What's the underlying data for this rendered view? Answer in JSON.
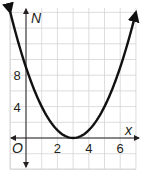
{
  "chart_data": {
    "type": "line",
    "title": "",
    "xlabel": "x",
    "ylabel": "N",
    "origin_label": "O",
    "function": "N = (x - 3)^2",
    "x": [
      -1,
      0,
      1,
      2,
      3,
      4,
      5,
      6,
      7
    ],
    "series": [
      {
        "name": "N",
        "values": [
          16,
          9,
          4,
          1,
          0,
          1,
          4,
          9,
          16
        ]
      }
    ],
    "x_ticks": [
      "2",
      "4",
      "6"
    ],
    "y_ticks": [
      "4",
      "8"
    ],
    "xlim": [
      -1,
      7
    ],
    "ylim": [
      -2,
      17
    ],
    "grid": true,
    "grid_step_x": 1,
    "grid_step_y": 2,
    "arrows_on_curve_ends": true,
    "colors": {
      "curve": "#111111",
      "axis": "#231f20",
      "grid": "#d4d4d4"
    }
  }
}
